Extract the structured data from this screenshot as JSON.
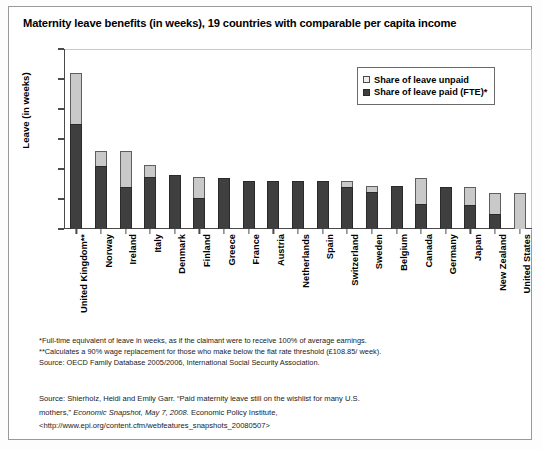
{
  "chart_data": {
    "type": "bar",
    "subtype": "stacked-vertical",
    "title": "Maternity leave benefits (in weeks), 19 countries with comparable per capita income",
    "xlabel": "",
    "ylabel": "Leave (in weeks)",
    "ylim": [
      0,
      60
    ],
    "yticks": [
      0,
      10,
      20,
      30,
      40,
      50,
      60
    ],
    "grid": false,
    "legend_position": "top-right",
    "categories": [
      "United Kingdom**",
      "Norway",
      "Ireland",
      "Italy",
      "Denmark",
      "Finland",
      "Greece",
      "France",
      "Austria",
      "Netherlands",
      "Spain",
      "Switzerland",
      "Sweden",
      "Belgium",
      "Canada",
      "Germany",
      "Japan",
      "New Zealand",
      "United States"
    ],
    "series": [
      {
        "name": "Share of leave paid (FTE)*",
        "color": "#3f3f3f",
        "values": [
          35,
          21,
          14,
          17.5,
          18,
          10.5,
          17,
          16,
          16,
          16,
          16,
          14,
          12.5,
          14.5,
          8.5,
          14,
          8,
          5,
          0
        ]
      },
      {
        "name": "Share of leave unpaid",
        "color": "#c9c9c9",
        "values": [
          17,
          5,
          12,
          4,
          0,
          7,
          0,
          0,
          0,
          0,
          0,
          2,
          2,
          0,
          8.5,
          0,
          6,
          7,
          12
        ]
      }
    ],
    "totals": [
      52,
      26,
      26,
      21.5,
      18,
      17.5,
      17,
      16,
      16,
      16,
      16,
      16,
      14.5,
      14.5,
      17,
      14,
      14,
      12,
      12
    ]
  },
  "legend": {
    "items": [
      {
        "label": "Share of leave unpaid",
        "swatch": "unpaid"
      },
      {
        "label": "Share of leave paid (FTE)*",
        "swatch": "paid"
      }
    ]
  },
  "notes": {
    "lines": [
      "*Full-time equivalent of leave in weeks, as if the claimant were to receive 100% of average earnings.",
      "**Calculates a 90% wage replacement for those who make below the flat rate threshold (£108.85/ week).",
      "Source: OECD Family Database 2005/2006, International Social Security Association."
    ]
  },
  "source": {
    "line1_a": "Source: Shierholz, Heidi and Emily Garr. “Paid maternity leave still on the wishlist for many U.S.",
    "line2_a": "mothers,” ",
    "line2_italic": "Economic Snapshot, May 7, 2008.",
    "line2_b": " Economic Policy Institute,",
    "line3": "<http://www.epi.org/content.cfm/webfeatures_snapshots_20080507>"
  }
}
